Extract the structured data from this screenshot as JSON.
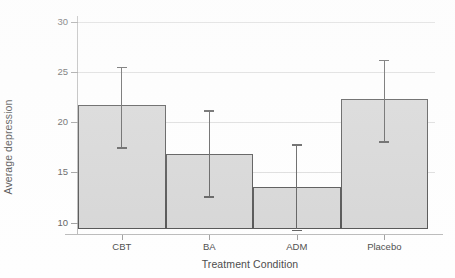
{
  "chart_data": {
    "type": "bar",
    "title": "",
    "xlabel": "Treatment Condition",
    "ylabel": "Average depression",
    "categories": [
      "CBT",
      "BA",
      "ADM",
      "Placebo"
    ],
    "values": [
      21.7,
      16.8,
      13.5,
      22.3
    ],
    "error_bars": {
      "lower": [
        17.5,
        12.6,
        9.3,
        18.1
      ],
      "upper": [
        25.5,
        21.2,
        17.8,
        26.2
      ]
    },
    "ylim": [
      9.3,
      30.6
    ],
    "yticks": [
      10,
      15,
      20,
      25,
      30
    ],
    "ytick_labels": [
      "10",
      "15",
      "20",
      "25",
      "30"
    ],
    "grid": "horizontal",
    "legend": "none",
    "bar_fill_color": "#d5d5d5",
    "bar_edge_color": "#4f4f4f",
    "error_bar_color": "#5b5b5b",
    "gridline_color": "#dcdcdc",
    "axis_color": "#b9b9b9",
    "baseline_value": 9.3
  }
}
